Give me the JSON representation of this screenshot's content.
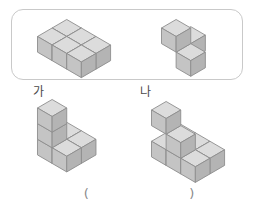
{
  "page": {
    "background_color": "#ffffff",
    "type": "math-worksheet-question",
    "answer_prompt": {
      "open_paren": "(",
      "blank_value": "",
      "close_paren": ")"
    }
  },
  "choices_box": {
    "border_color": "#c9c9c9",
    "x": 11,
    "y": 9,
    "width": 232,
    "height": 71,
    "options": [
      {
        "label": "가",
        "label_x": 33,
        "label_y": 86,
        "cube_count": 6,
        "description": "flat 2-layer slab of cubes, 3 cubes wide"
      },
      {
        "label": "나",
        "label_x": 140,
        "label_y": 86,
        "cube_count": 3,
        "description": "one cube on top of two cubes arranged in an L"
      }
    ]
  },
  "figures": [
    {
      "name": "choice-ga-figure",
      "x": 36,
      "y": 18,
      "cubes": [
        {
          "cx": 0,
          "cy": 1,
          "cz": 0
        },
        {
          "cx": 1,
          "cy": 1,
          "cz": 0
        },
        {
          "cx": 2,
          "cy": 1,
          "cz": 0
        },
        {
          "cx": 0,
          "cy": 0,
          "cz": 0
        },
        {
          "cx": 1,
          "cy": 0,
          "cz": 0
        },
        {
          "cx": 2,
          "cy": 0,
          "cz": 0
        }
      ]
    },
    {
      "name": "choice-na-figure",
      "x": 160,
      "y": 18,
      "cubes": [
        {
          "cx": 0,
          "cy": 0,
          "cz": 0
        },
        {
          "cx": 1,
          "cy": 1,
          "cz": 0
        },
        {
          "cx": 0,
          "cy": 1,
          "cz": 1
        }
      ]
    },
    {
      "name": "question-figure-left",
      "x": 36,
      "y": 98,
      "cubes": [
        {
          "cx": 0,
          "cy": 0,
          "cz": 0
        },
        {
          "cx": 1,
          "cy": 0,
          "cz": 0
        },
        {
          "cx": 0,
          "cy": 1,
          "cz": 0
        },
        {
          "cx": 1,
          "cy": 1,
          "cz": 0
        },
        {
          "cx": 0,
          "cy": 1,
          "cz": 1
        },
        {
          "cx": 0,
          "cy": 1,
          "cz": 2
        }
      ]
    },
    {
      "name": "question-figure-right",
      "x": 150,
      "y": 100,
      "cubes": [
        {
          "cx": 0,
          "cy": 0,
          "cz": 0
        },
        {
          "cx": 1,
          "cy": 0,
          "cz": 0
        },
        {
          "cx": 2,
          "cy": 0,
          "cz": 0
        },
        {
          "cx": 0,
          "cy": 1,
          "cz": 0
        },
        {
          "cx": 1,
          "cy": 1,
          "cz": 0
        },
        {
          "cx": 2,
          "cy": 1,
          "cz": 0
        },
        {
          "cx": 1,
          "cy": 1,
          "cz": 1
        },
        {
          "cx": 0,
          "cy": 1,
          "cz": 2
        }
      ]
    }
  ],
  "cube_style": {
    "top_face_color": "#dcdcdc",
    "left_face_color": "#c4c4c4",
    "right_face_color": "#b4b4b4",
    "edge_color": "#8d8d8d",
    "size": 17
  }
}
